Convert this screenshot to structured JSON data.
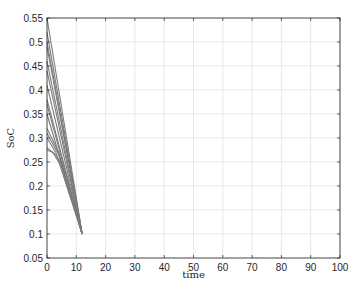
{
  "chart_data": {
    "type": "line",
    "title": "",
    "xlabel": "time",
    "ylabel": "SoC",
    "xlim": [
      0,
      100
    ],
    "ylim": [
      0.05,
      0.55
    ],
    "xticks": [
      0,
      10,
      20,
      30,
      40,
      50,
      60,
      70,
      80,
      90,
      100
    ],
    "yticks": [
      0.05,
      0.1,
      0.15,
      0.2,
      0.25,
      0.3,
      0.35,
      0.4,
      0.45,
      0.5,
      0.55
    ],
    "xtick_labels": [
      "0",
      "10",
      "20",
      "30",
      "40",
      "50",
      "60",
      "70",
      "80",
      "90",
      "100"
    ],
    "ytick_labels": [
      "0.05",
      "0.1",
      "0.15",
      "0.2",
      "0.25",
      "0.3",
      "0.35",
      "0.4",
      "0.45",
      "0.5",
      "0.55"
    ],
    "grid": true,
    "legend": null,
    "line_color": "#7a7a7a",
    "series": [
      {
        "name": "trajectory-1",
        "x": [
          0,
          12
        ],
        "y": [
          0.55,
          0.1
        ]
      },
      {
        "name": "trajectory-2",
        "x": [
          0,
          12
        ],
        "y": [
          0.52,
          0.1
        ]
      },
      {
        "name": "trajectory-3",
        "x": [
          0,
          12
        ],
        "y": [
          0.5,
          0.1
        ]
      },
      {
        "name": "trajectory-4",
        "x": [
          0,
          12
        ],
        "y": [
          0.49,
          0.1
        ]
      },
      {
        "name": "trajectory-5",
        "x": [
          0,
          12
        ],
        "y": [
          0.46,
          0.1
        ]
      },
      {
        "name": "trajectory-6",
        "x": [
          0,
          12
        ],
        "y": [
          0.44,
          0.1
        ]
      },
      {
        "name": "trajectory-7",
        "x": [
          0,
          12
        ],
        "y": [
          0.41,
          0.1
        ]
      },
      {
        "name": "trajectory-8",
        "x": [
          0,
          12
        ],
        "y": [
          0.38,
          0.1
        ]
      },
      {
        "name": "trajectory-9",
        "x": [
          0,
          12
        ],
        "y": [
          0.37,
          0.1
        ]
      },
      {
        "name": "trajectory-10",
        "x": [
          0,
          12
        ],
        "y": [
          0.35,
          0.1
        ]
      },
      {
        "name": "trajectory-11",
        "x": [
          0,
          4,
          12
        ],
        "y": [
          0.32,
          0.27,
          0.1
        ]
      },
      {
        "name": "trajectory-12",
        "x": [
          0,
          4,
          12
        ],
        "y": [
          0.31,
          0.265,
          0.1
        ]
      },
      {
        "name": "trajectory-13",
        "x": [
          0,
          3,
          12
        ],
        "y": [
          0.3,
          0.27,
          0.1
        ]
      },
      {
        "name": "trajectory-14",
        "x": [
          0,
          3,
          5,
          12
        ],
        "y": [
          0.28,
          0.265,
          0.245,
          0.1
        ]
      },
      {
        "name": "trajectory-15",
        "x": [
          0,
          2,
          5,
          12
        ],
        "y": [
          0.275,
          0.27,
          0.24,
          0.1
        ]
      }
    ]
  }
}
